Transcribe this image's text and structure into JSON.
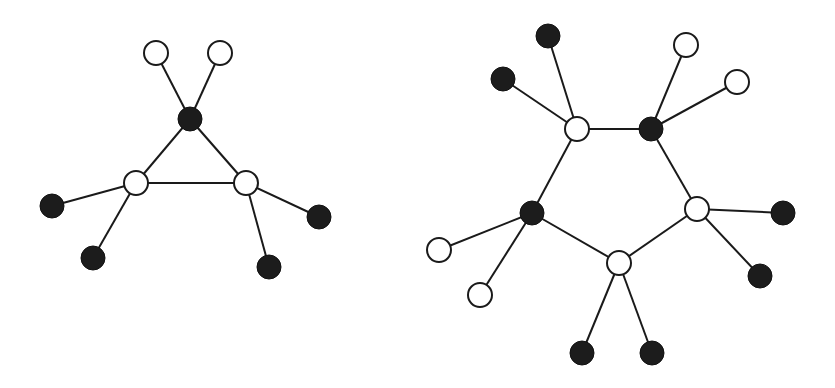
{
  "diagram": {
    "colors": {
      "edge": "#1a1a1a",
      "open_fill": "#ffffff",
      "filled_fill": "#1c1c1c",
      "background": "#ffffff"
    },
    "node_radius": 12,
    "graphs": [
      {
        "name": "three-ring",
        "nodes": [
          {
            "id": "a1",
            "x": 156,
            "y": 53,
            "type": "open"
          },
          {
            "id": "a2",
            "x": 220,
            "y": 53,
            "type": "open"
          },
          {
            "id": "a3",
            "x": 190,
            "y": 119,
            "type": "filled"
          },
          {
            "id": "a4",
            "x": 136,
            "y": 183,
            "type": "open"
          },
          {
            "id": "a5",
            "x": 246,
            "y": 183,
            "type": "open"
          },
          {
            "id": "a6",
            "x": 52,
            "y": 206,
            "type": "filled"
          },
          {
            "id": "a7",
            "x": 93,
            "y": 258,
            "type": "filled"
          },
          {
            "id": "a8",
            "x": 319,
            "y": 217,
            "type": "filled"
          },
          {
            "id": "a9",
            "x": 269,
            "y": 267,
            "type": "filled"
          }
        ],
        "edges": [
          [
            "a1",
            "a3"
          ],
          [
            "a2",
            "a3"
          ],
          [
            "a3",
            "a4"
          ],
          [
            "a3",
            "a5"
          ],
          [
            "a4",
            "a5"
          ],
          [
            "a4",
            "a6"
          ],
          [
            "a4",
            "a7"
          ],
          [
            "a5",
            "a8"
          ],
          [
            "a5",
            "a9"
          ]
        ]
      },
      {
        "name": "five-ring",
        "nodes": [
          {
            "id": "b1",
            "x": 548,
            "y": 36,
            "type": "filled"
          },
          {
            "id": "b2",
            "x": 503,
            "y": 79,
            "type": "filled"
          },
          {
            "id": "b3",
            "x": 577,
            "y": 129,
            "type": "open"
          },
          {
            "id": "b4",
            "x": 651,
            "y": 129,
            "type": "filled"
          },
          {
            "id": "b5",
            "x": 686,
            "y": 45,
            "type": "open"
          },
          {
            "id": "b6",
            "x": 737,
            "y": 82,
            "type": "open"
          },
          {
            "id": "b7",
            "x": 532,
            "y": 213,
            "type": "filled"
          },
          {
            "id": "b8",
            "x": 697,
            "y": 209,
            "type": "open"
          },
          {
            "id": "b9",
            "x": 783,
            "y": 213,
            "type": "filled"
          },
          {
            "id": "b10",
            "x": 760,
            "y": 276,
            "type": "filled"
          },
          {
            "id": "b11",
            "x": 619,
            "y": 263,
            "type": "open"
          },
          {
            "id": "b12",
            "x": 439,
            "y": 250,
            "type": "open"
          },
          {
            "id": "b13",
            "x": 480,
            "y": 295,
            "type": "open"
          },
          {
            "id": "b14",
            "x": 582,
            "y": 353,
            "type": "filled"
          },
          {
            "id": "b15",
            "x": 652,
            "y": 353,
            "type": "filled"
          }
        ],
        "edges": [
          [
            "b1",
            "b3"
          ],
          [
            "b2",
            "b3"
          ],
          [
            "b3",
            "b4"
          ],
          [
            "b4",
            "b5"
          ],
          [
            "b4",
            "b6"
          ],
          [
            "b3",
            "b7"
          ],
          [
            "b4",
            "b8"
          ],
          [
            "b8",
            "b9"
          ],
          [
            "b8",
            "b10"
          ],
          [
            "b8",
            "b11"
          ],
          [
            "b7",
            "b11"
          ],
          [
            "b7",
            "b12"
          ],
          [
            "b7",
            "b13"
          ],
          [
            "b11",
            "b14"
          ],
          [
            "b11",
            "b15"
          ]
        ]
      }
    ]
  }
}
